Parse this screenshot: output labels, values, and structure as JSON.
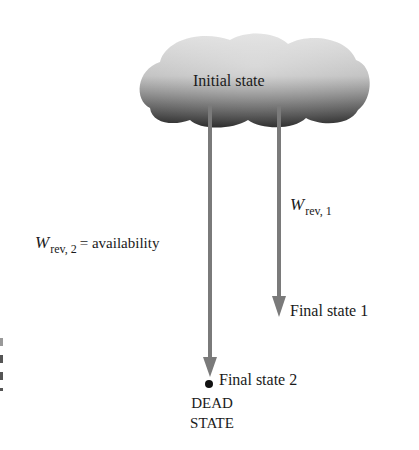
{
  "diagram": {
    "type": "availability-state-diagram",
    "colors": {
      "arrow": "#7a7a7a",
      "cloud_light": "#d8d8d8",
      "cloud_dark": "#2e2e2e",
      "text": "#1a1a1a",
      "dead_state_dot": "#111111"
    },
    "nodes": {
      "initial": {
        "label": "Initial state"
      },
      "final1": {
        "label": "Final state 1"
      },
      "final2": {
        "label": "Final state 2"
      },
      "dead": {
        "line1": "DEAD",
        "line2": "STATE"
      }
    },
    "edges": [
      {
        "from": "initial",
        "to": "final1",
        "label_symbol": "W",
        "label_subscript": "rev, 1",
        "label_suffix": ""
      },
      {
        "from": "initial",
        "to": "final2",
        "label_symbol": "W",
        "label_subscript": "rev, 2",
        "label_suffix": "= availability"
      }
    ]
  }
}
